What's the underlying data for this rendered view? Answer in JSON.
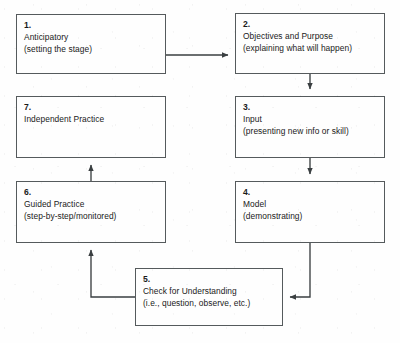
{
  "diagram": {
    "background_color": "#fefefe",
    "line_color": "#555a5c",
    "text_color": "#1a1a1a",
    "nodes": [
      {
        "id": "1",
        "number": "1.",
        "heading": "Anticipatory",
        "detail": "(setting the stage)"
      },
      {
        "id": "2",
        "number": "2.",
        "heading": "Objectives and Purpose",
        "detail": "(explaining what will happen)"
      },
      {
        "id": "3",
        "number": "3.",
        "heading": "Input",
        "detail": "(presenting new info or skill)"
      },
      {
        "id": "4",
        "number": "4.",
        "heading": "Model",
        "detail": "(demonstrating)"
      },
      {
        "id": "5",
        "number": "5.",
        "heading": "Check for Understanding",
        "detail": "(i.e., question, observe, etc.)"
      },
      {
        "id": "6",
        "number": "6.",
        "heading": "Guided Practice",
        "detail": "(step-by-step/monitored)"
      },
      {
        "id": "7",
        "number": "7.",
        "heading": "Independent Practice",
        "detail": ""
      }
    ],
    "edges": [
      {
        "from": "1",
        "to": "2",
        "direction": "right"
      },
      {
        "from": "2",
        "to": "3",
        "direction": "down"
      },
      {
        "from": "3",
        "to": "4",
        "direction": "down"
      },
      {
        "from": "4",
        "to": "5",
        "direction": "down-left"
      },
      {
        "from": "5",
        "to": "6",
        "direction": "left-up"
      },
      {
        "from": "6",
        "to": "7",
        "direction": "up"
      }
    ]
  }
}
